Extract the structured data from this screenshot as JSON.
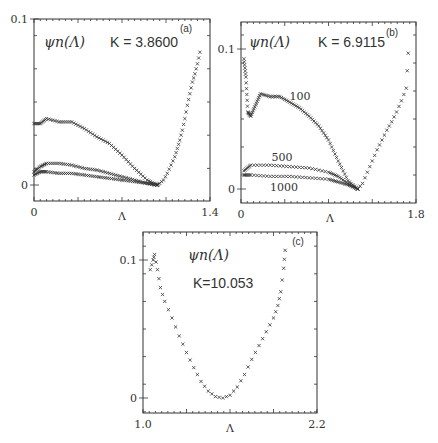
{
  "figure": {
    "panels": [
      {
        "id": "a",
        "panel_label": "(a)",
        "psi_label": "ψn(Λ)",
        "k_label": "K = 3.8600"
      },
      {
        "id": "b",
        "panel_label": "(b)",
        "psi_label": "ψn(Λ)",
        "k_label": "K = 6.9115",
        "curve_labels": [
          "100",
          "500",
          "1000"
        ]
      },
      {
        "id": "c",
        "panel_label": "(c)",
        "psi_label": "ψn(Λ)",
        "k_label": "K=10.053"
      }
    ]
  },
  "chart_data": [
    {
      "type": "scatter",
      "title": "ψn(Λ) K=3.8600 (a)",
      "xlabel": "Λ",
      "ylabel": "",
      "xlim": [
        0,
        1.4
      ],
      "ylim": [
        -0.01,
        0.1
      ],
      "x_tick_labels": [
        "0",
        "1.4"
      ],
      "y_tick_labels": [
        "0",
        "0.1"
      ],
      "grid": false,
      "series": [
        {
          "name": "upper",
          "points": [
            [
              0.0,
              0.037
            ],
            [
              0.05,
              0.037
            ],
            [
              0.1,
              0.04
            ],
            [
              0.2,
              0.038
            ],
            [
              0.3,
              0.038
            ],
            [
              0.4,
              0.034
            ],
            [
              0.5,
              0.029
            ],
            [
              0.6,
              0.025
            ],
            [
              0.7,
              0.018
            ],
            [
              0.8,
              0.01
            ],
            [
              0.9,
              0.003
            ],
            [
              0.98,
              0.0
            ]
          ]
        },
        {
          "name": "middle",
          "points": [
            [
              0.0,
              0.008
            ],
            [
              0.05,
              0.011
            ],
            [
              0.1,
              0.013
            ],
            [
              0.2,
              0.013
            ],
            [
              0.3,
              0.012
            ],
            [
              0.4,
              0.01
            ],
            [
              0.5,
              0.009
            ],
            [
              0.6,
              0.007
            ],
            [
              0.7,
              0.005
            ],
            [
              0.8,
              0.003
            ],
            [
              0.9,
              0.001
            ],
            [
              0.98,
              0.0
            ]
          ]
        },
        {
          "name": "lower",
          "points": [
            [
              0.0,
              0.006
            ],
            [
              0.05,
              0.008
            ],
            [
              0.1,
              0.008
            ],
            [
              0.2,
              0.007
            ],
            [
              0.3,
              0.007
            ],
            [
              0.4,
              0.006
            ],
            [
              0.5,
              0.005
            ],
            [
              0.6,
              0.004
            ],
            [
              0.7,
              0.003
            ],
            [
              0.8,
              0.002
            ],
            [
              0.9,
              0.001
            ],
            [
              0.98,
              0.0
            ]
          ]
        },
        {
          "name": "right branch",
          "points": [
            [
              0.98,
              0.0
            ],
            [
              1.0,
              0.001
            ],
            [
              1.03,
              0.003
            ],
            [
              1.06,
              0.007
            ],
            [
              1.09,
              0.012
            ],
            [
              1.12,
              0.017
            ],
            [
              1.14,
              0.022
            ],
            [
              1.16,
              0.027
            ],
            [
              1.18,
              0.033
            ],
            [
              1.2,
              0.04
            ],
            [
              1.22,
              0.048
            ],
            [
              1.24,
              0.055
            ],
            [
              1.26,
              0.062
            ],
            [
              1.28,
              0.067
            ],
            [
              1.3,
              0.073
            ],
            [
              1.32,
              0.08
            ]
          ]
        }
      ]
    },
    {
      "type": "scatter",
      "title": "ψn(Λ) K=6.9115 (b)",
      "xlabel": "Λ",
      "ylabel": "",
      "xlim": [
        0,
        1.8
      ],
      "ylim": [
        -0.01,
        0.12
      ],
      "x_tick_labels": [
        "0",
        "1.8"
      ],
      "y_tick_labels": [
        "0",
        "0.1"
      ],
      "grid": false,
      "annotations": [
        "100",
        "500",
        "1000"
      ],
      "series": [
        {
          "name": "100",
          "points": [
            [
              0.03,
              0.093
            ],
            [
              0.05,
              0.08
            ],
            [
              0.07,
              0.055
            ],
            [
              0.1,
              0.052
            ],
            [
              0.15,
              0.06
            ],
            [
              0.2,
              0.068
            ],
            [
              0.3,
              0.066
            ],
            [
              0.4,
              0.066
            ],
            [
              0.5,
              0.062
            ],
            [
              0.6,
              0.058
            ],
            [
              0.7,
              0.052
            ],
            [
              0.8,
              0.045
            ],
            [
              0.9,
              0.035
            ],
            [
              1.0,
              0.02
            ],
            [
              1.1,
              0.006
            ],
            [
              1.2,
              0.0
            ]
          ]
        },
        {
          "name": "500",
          "points": [
            [
              0.03,
              0.013
            ],
            [
              0.1,
              0.017
            ],
            [
              0.3,
              0.017
            ],
            [
              0.5,
              0.016
            ],
            [
              0.7,
              0.015
            ],
            [
              0.9,
              0.012
            ],
            [
              1.0,
              0.009
            ],
            [
              1.1,
              0.004
            ],
            [
              1.2,
              0.0
            ]
          ]
        },
        {
          "name": "1000",
          "points": [
            [
              0.03,
              0.01
            ],
            [
              0.1,
              0.01
            ],
            [
              0.3,
              0.009
            ],
            [
              0.5,
              0.009
            ],
            [
              0.7,
              0.008
            ],
            [
              0.9,
              0.007
            ],
            [
              1.0,
              0.005
            ],
            [
              1.1,
              0.003
            ],
            [
              1.2,
              0.0
            ]
          ]
        },
        {
          "name": "right branch",
          "points": [
            [
              1.2,
              0.0
            ],
            [
              1.25,
              0.004
            ],
            [
              1.3,
              0.012
            ],
            [
              1.35,
              0.02
            ],
            [
              1.4,
              0.028
            ],
            [
              1.45,
              0.035
            ],
            [
              1.5,
              0.042
            ],
            [
              1.55,
              0.048
            ],
            [
              1.6,
              0.055
            ],
            [
              1.65,
              0.063
            ],
            [
              1.7,
              0.072
            ],
            [
              1.72,
              0.097
            ]
          ]
        }
      ]
    },
    {
      "type": "scatter",
      "title": "ψn(Λ) K=10.053 (c)",
      "xlabel": "Λ",
      "ylabel": "",
      "xlim": [
        1.0,
        2.2
      ],
      "ylim": [
        -0.01,
        0.11
      ],
      "x_tick_labels": [
        "1.0",
        "Λ",
        "2.2"
      ],
      "y_tick_labels": [
        "0",
        "0.1"
      ],
      "grid": false,
      "series": [
        {
          "name": "ψn",
          "points": [
            [
              1.05,
              0.093
            ],
            [
              1.07,
              0.1
            ],
            [
              1.08,
              0.104
            ],
            [
              1.1,
              0.093
            ],
            [
              1.12,
              0.08
            ],
            [
              1.15,
              0.07
            ],
            [
              1.2,
              0.058
            ],
            [
              1.25,
              0.045
            ],
            [
              1.3,
              0.033
            ],
            [
              1.35,
              0.022
            ],
            [
              1.4,
              0.012
            ],
            [
              1.45,
              0.005
            ],
            [
              1.5,
              0.001
            ],
            [
              1.55,
              0.0
            ],
            [
              1.6,
              0.002
            ],
            [
              1.65,
              0.008
            ],
            [
              1.7,
              0.017
            ],
            [
              1.75,
              0.028
            ],
            [
              1.8,
              0.038
            ],
            [
              1.85,
              0.048
            ],
            [
              1.9,
              0.058
            ],
            [
              1.93,
              0.067
            ],
            [
              1.95,
              0.077
            ],
            [
              1.97,
              0.094
            ],
            [
              1.98,
              0.107
            ]
          ]
        }
      ]
    }
  ]
}
